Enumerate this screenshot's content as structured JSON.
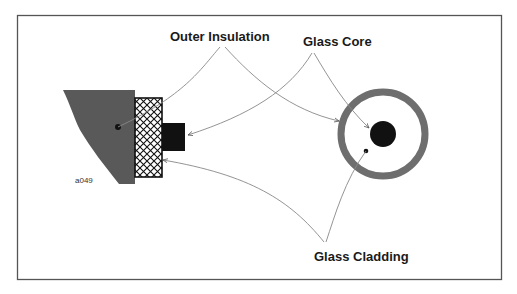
{
  "diagram": {
    "type": "fiber-optic-cable-cross-section",
    "labels": {
      "outer_insulation": "Outer Insulation",
      "glass_core": "Glass Core",
      "glass_cladding": "Glass Cladding",
      "figure_id": "a049"
    },
    "colors": {
      "frame": "#555555",
      "cable_body": "#595959",
      "core": "#111111",
      "cladding_ring": "#6e6e6e",
      "leader_lines": "#777777",
      "text": "#1a1a1a"
    }
  }
}
